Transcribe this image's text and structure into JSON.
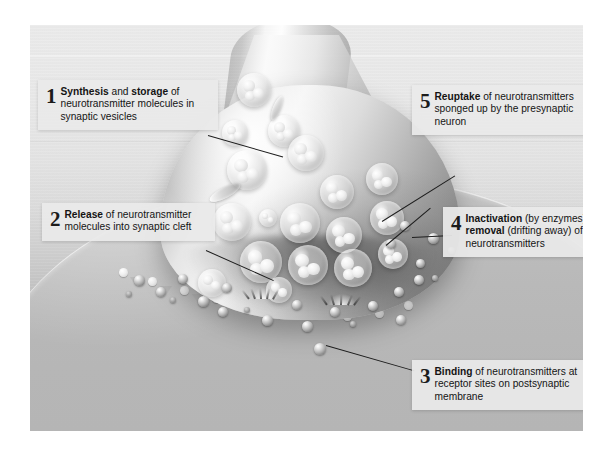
{
  "diagram": {
    "style": "grayscale airbrush illustration",
    "structures": {
      "presynaptic_terminal": "axon terminal (presynaptic neuron)",
      "synaptic_vesicles": "synaptic vesicles containing neurotransmitter molecules",
      "synaptic_cleft": "synaptic cleft",
      "postsynaptic_membrane": "postsynaptic membrane with receptor sites",
      "neurotransmitters": "neurotransmitter molecules"
    }
  },
  "labels": [
    {
      "number": "1",
      "bold_a": "Synthesis",
      "mid": " and ",
      "bold_b": "storage",
      "rest": " of neurotransmitter molecules in synaptic vesicles",
      "full_text": "Synthesis and storage of neurotransmitter molecules in synaptic vesicles"
    },
    {
      "number": "2",
      "bold_a": "Release",
      "rest": " of neurotransmitter molecules into synaptic cleft",
      "full_text": "Release of neurotransmitter molecules into synaptic cleft"
    },
    {
      "number": "3",
      "bold_a": "Binding",
      "rest": " of neurotransmitters at receptor sites on postsynaptic membrane",
      "full_text": "Binding of neurotransmitters at receptor sites on postsynaptic membrane"
    },
    {
      "number": "4",
      "bold_a": "Inactivation",
      "mid": " (by enzymes) or ",
      "bold_b": "removal",
      "rest": " (drifting away) of neurotransmitters",
      "full_text": "Inactivation (by enzymes) or removal (drifting away) of neurotransmitters"
    },
    {
      "number": "5",
      "bold_a": "Reuptake",
      "rest": " of neurotransmitters sponged up by the presynaptic neuron",
      "full_text": "Reuptake of neurotransmitters sponged up by the presynaptic neuron"
    }
  ],
  "colors": {
    "page_background": "#ffffff",
    "plate_top": "#ebebeb",
    "plate_bottom": "#b7b7b7",
    "label_background": "#e9e9e9",
    "label_text": "#141414",
    "leader_line": "#1d1d1d"
  }
}
